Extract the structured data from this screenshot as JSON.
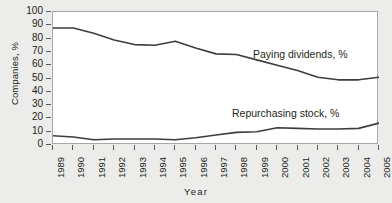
{
  "chart_data": {
    "type": "line",
    "title": "",
    "xlabel": "Year",
    "ylabel": "Companies, %",
    "x": [
      1989,
      1990,
      1991,
      1992,
      1993,
      1994,
      1995,
      1996,
      1997,
      1998,
      1999,
      2000,
      2001,
      2002,
      2003,
      2004,
      2005
    ],
    "categories": [
      "1989",
      "1990",
      "1991",
      "1992",
      "1993",
      "1994",
      "1995",
      "1996",
      "1997",
      "1998",
      "1999",
      "2000",
      "2001",
      "2002",
      "2003",
      "2004",
      "2005"
    ],
    "xlim": [
      1989,
      2005
    ],
    "ylim": [
      0,
      100
    ],
    "yticks": [
      0,
      10,
      20,
      30,
      40,
      50,
      60,
      70,
      80,
      90,
      100
    ],
    "grid": false,
    "legend": "inline-annotations",
    "series": [
      {
        "name": "Paying dividends, %",
        "annotation": "Paying dividends, %",
        "color": "#3d3d3d",
        "values": [
          88,
          88,
          84,
          79,
          75.5,
          75,
          78,
          73,
          68.5,
          68,
          64,
          60,
          56,
          51,
          49,
          49,
          51
        ]
      },
      {
        "name": "Repurchasing stock, %",
        "annotation": "Repurchasing stock, %",
        "color": "#3d3d3d",
        "values": [
          7,
          6,
          4,
          4.5,
          4.5,
          4.5,
          4,
          5.5,
          7.5,
          9.5,
          10,
          13,
          12.5,
          12,
          12,
          12.5,
          16.5
        ]
      }
    ]
  },
  "axes": {
    "y_title": "Companies, %",
    "x_title": "Year"
  },
  "colors": {
    "figure_background": "#ececeb",
    "plot_background": "#ffffff",
    "frame": "#a8a8a6",
    "line": "#3d3d3d",
    "text": "#231f20"
  }
}
